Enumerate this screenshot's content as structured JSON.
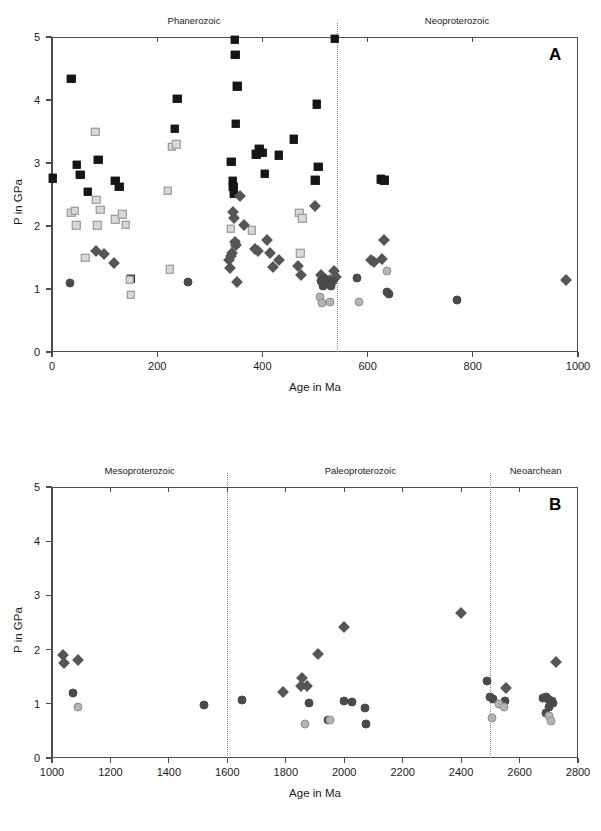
{
  "figure": {
    "panels": [
      {
        "id": "A",
        "letter": "A",
        "xlabel": "Age in Ma",
        "ylabel": "P in GPa",
        "xlim": [
          0,
          1000
        ],
        "ylim": [
          0,
          5
        ],
        "xticks": [
          0,
          200,
          400,
          600,
          800,
          1000
        ],
        "yticks": [
          0,
          1,
          2,
          3,
          4,
          5
        ],
        "eras": [
          {
            "label": "Phanerozoic",
            "center": 270
          },
          {
            "label": "Neoproterozoic",
            "center": 770
          }
        ],
        "dividers": [
          541
        ]
      },
      {
        "id": "B",
        "letter": "B",
        "xlabel": "Age in Ma",
        "ylabel": "P in GPa",
        "xlim": [
          1000,
          2800
        ],
        "ylim": [
          0,
          5
        ],
        "xticks": [
          1000,
          1200,
          1400,
          1600,
          1800,
          2000,
          2200,
          2400,
          2600,
          2800
        ],
        "yticks": [
          0,
          1,
          2,
          3,
          4,
          5
        ],
        "eras": [
          {
            "label": "Mesoproterozoic",
            "center": 1300
          },
          {
            "label": "Paleoproterozoic",
            "center": 2055
          },
          {
            "label": "Neoarchean",
            "center": 2655
          }
        ],
        "dividers": [
          1600,
          2500
        ]
      }
    ]
  },
  "colors": {
    "black_square": "#161616",
    "light_square_fill": "#d9d9d9",
    "light_square_edge": "#8f8f8f",
    "dark_diamond": "#565656",
    "dark_circle": "#4a4a4a",
    "light_circle_fill": "#b4b4b4",
    "light_circle_edge": "#8f8f8f",
    "axis": "#4d4d4d",
    "divider": "#8c8c8c",
    "background": "#ffffff"
  },
  "chart_data": [
    {
      "type": "scatter",
      "panel": "A",
      "title": "",
      "xlabel": "Age in Ma",
      "ylabel": "P in GPa",
      "xlim": [
        0,
        1000
      ],
      "ylim": [
        0,
        5
      ],
      "xticks": [
        0,
        200,
        400,
        600,
        800,
        1000
      ],
      "yticks": [
        0,
        1,
        2,
        3,
        4,
        5
      ],
      "grid": false,
      "legend": "none",
      "annotations": [
        "Phanerozoic",
        "Neoproterozoic",
        "A"
      ],
      "vertical_dotted_lines": [
        541
      ],
      "series": [
        {
          "name": "black-square",
          "marker": "square",
          "fill": "#161616",
          "points": [
            [
              1,
              2.76
            ],
            [
              37,
              4.34
            ],
            [
              47,
              2.97
            ],
            [
              54,
              2.81
            ],
            [
              68,
              2.54
            ],
            [
              88,
              3.05
            ],
            [
              120,
              2.72
            ],
            [
              128,
              2.62
            ],
            [
              150,
              1.16
            ],
            [
              233,
              3.54
            ],
            [
              238,
              4.02
            ],
            [
              341,
              3.02
            ],
            [
              344,
              2.72
            ],
            [
              345,
              2.62
            ],
            [
              346,
              2.52
            ],
            [
              347,
              4.96
            ],
            [
              348,
              4.72
            ],
            [
              352,
              4.22
            ],
            [
              349,
              3.62
            ],
            [
              388,
              3.14
            ],
            [
              394,
              3.23
            ],
            [
              400,
              3.16
            ],
            [
              404,
              2.83
            ],
            [
              431,
              3.12
            ],
            [
              460,
              3.38
            ],
            [
              500,
              2.73
            ],
            [
              503,
              3.93
            ],
            [
              506,
              2.94
            ],
            [
              538,
              4.97
            ],
            [
              625,
              2.74
            ],
            [
              632,
              2.73
            ]
          ]
        },
        {
          "name": "light-square",
          "marker": "square",
          "fill": "#d9d9d9",
          "edge": "#8f8f8f",
          "points": [
            [
              37,
              2.21
            ],
            [
              43,
              2.24
            ],
            [
              46,
              2.01
            ],
            [
              63,
              1.5
            ],
            [
              82,
              3.5
            ],
            [
              84,
              2.42
            ],
            [
              86,
              2.01
            ],
            [
              92,
              2.26
            ],
            [
              120,
              2.11
            ],
            [
              134,
              2.19
            ],
            [
              140,
              2.02
            ],
            [
              148,
              1.15
            ],
            [
              150,
              0.91
            ],
            [
              220,
              2.56
            ],
            [
              228,
              3.26
            ],
            [
              236,
              3.3
            ],
            [
              224,
              1.31
            ],
            [
              340,
              1.96
            ],
            [
              348,
              1.72
            ],
            [
              380,
              1.93
            ],
            [
              470,
              2.21
            ],
            [
              476,
              2.12
            ],
            [
              472,
              1.57
            ]
          ]
        },
        {
          "name": "dark-diamond",
          "marker": "diamond",
          "fill": "#565656",
          "points": [
            [
              84,
              1.61
            ],
            [
              99,
              1.56
            ],
            [
              118,
              1.42
            ],
            [
              336,
              1.46
            ],
            [
              338,
              1.34
            ],
            [
              340,
              1.52
            ],
            [
              342,
              1.57
            ],
            [
              344,
              2.22
            ],
            [
              346,
              2.13
            ],
            [
              347,
              1.74
            ],
            [
              349,
              1.7
            ],
            [
              352,
              1.11
            ],
            [
              358,
              2.47
            ],
            [
              365,
              2.02
            ],
            [
              386,
              1.64
            ],
            [
              392,
              1.61
            ],
            [
              408,
              1.77
            ],
            [
              414,
              1.57
            ],
            [
              420,
              1.35
            ],
            [
              432,
              1.46
            ],
            [
              468,
              1.37
            ],
            [
              474,
              1.22
            ],
            [
              500,
              2.32
            ],
            [
              512,
              1.22
            ],
            [
              528,
              1.14
            ],
            [
              536,
              1.28
            ],
            [
              540,
              1.19
            ],
            [
              606,
              1.46
            ],
            [
              612,
              1.43
            ],
            [
              628,
              1.47
            ],
            [
              632,
              1.77
            ],
            [
              978,
              1.15
            ]
          ]
        },
        {
          "name": "dark-circle",
          "marker": "circle",
          "fill": "#4a4a4a",
          "points": [
            [
              35,
              1.1
            ],
            [
              258,
              1.11
            ],
            [
              512,
              1.13
            ],
            [
              516,
              1.04
            ],
            [
              518,
              1.18
            ],
            [
              524,
              1.08
            ],
            [
              530,
              1.05
            ],
            [
              534,
              1.13
            ],
            [
              580,
              1.17
            ],
            [
              637,
              0.95
            ],
            [
              641,
              0.92
            ],
            [
              770,
              0.83
            ]
          ]
        },
        {
          "name": "light-circle",
          "marker": "circle",
          "fill": "#b4b4b4",
          "edge": "#8f8f8f",
          "points": [
            [
              510,
              0.88
            ],
            [
              514,
              0.77
            ],
            [
              528,
              0.8
            ],
            [
              583,
              0.79
            ],
            [
              636,
              1.28
            ]
          ]
        }
      ]
    },
    {
      "type": "scatter",
      "panel": "B",
      "title": "",
      "xlabel": "Age in Ma",
      "ylabel": "P in GPa",
      "xlim": [
        1000,
        2800
      ],
      "ylim": [
        0,
        5
      ],
      "xticks": [
        1000,
        1200,
        1400,
        1600,
        1800,
        2000,
        2200,
        2400,
        2600,
        2800
      ],
      "yticks": [
        0,
        1,
        2,
        3,
        4,
        5
      ],
      "grid": false,
      "legend": "none",
      "annotations": [
        "Mesoproterozoic",
        "Paleoproterozoic",
        "Neoarchean",
        "B"
      ],
      "vertical_dotted_lines": [
        1600,
        2500
      ],
      "series": [
        {
          "name": "dark-diamond",
          "marker": "diamond",
          "fill": "#565656",
          "points": [
            [
              1036,
              1.9
            ],
            [
              1040,
              1.76
            ],
            [
              1090,
              1.8
            ],
            [
              1790,
              1.22
            ],
            [
              1855,
              1.47
            ],
            [
              1852,
              1.33
            ],
            [
              1872,
              1.33
            ],
            [
              1910,
              1.92
            ],
            [
              2000,
              2.42
            ],
            [
              2400,
              2.68
            ],
            [
              2555,
              1.29
            ],
            [
              2725,
              1.78
            ]
          ]
        },
        {
          "name": "dark-circle",
          "marker": "circle",
          "fill": "#4a4a4a",
          "points": [
            [
              1072,
              1.2
            ],
            [
              1520,
              0.97
            ],
            [
              1650,
              1.07
            ],
            [
              1880,
              1.02
            ],
            [
              1945,
              0.7
            ],
            [
              2000,
              1.06
            ],
            [
              2025,
              1.03
            ],
            [
              2070,
              0.93
            ],
            [
              2075,
              0.62
            ],
            [
              2490,
              1.42
            ],
            [
              2500,
              1.13
            ],
            [
              2510,
              1.08
            ],
            [
              2550,
              1.05
            ],
            [
              2680,
              1.1
            ],
            [
              2690,
              1.13
            ],
            [
              2697,
              1.08
            ],
            [
              2700,
              0.95
            ],
            [
              2710,
              1.05
            ],
            [
              2715,
              1.02
            ],
            [
              2690,
              0.83
            ]
          ]
        },
        {
          "name": "light-circle",
          "marker": "circle",
          "fill": "#b4b4b4",
          "edge": "#8f8f8f",
          "points": [
            [
              1090,
              0.94
            ],
            [
              1865,
              0.62
            ],
            [
              1950,
              0.7
            ],
            [
              2505,
              0.74
            ],
            [
              2530,
              1.0
            ],
            [
              2548,
              0.95
            ],
            [
              2700,
              0.78
            ],
            [
              2707,
              0.68
            ]
          ]
        }
      ]
    }
  ]
}
